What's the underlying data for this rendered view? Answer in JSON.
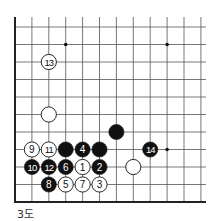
{
  "diagram": {
    "caption": "3도",
    "grid": {
      "cols": 12,
      "rows": 11,
      "x0": 15,
      "dx": 16.9,
      "y0": 27,
      "dy": 17.5,
      "top_y": 17,
      "open_right_x": 206
    },
    "star_points": [
      {
        "c": 3,
        "r": 1
      },
      {
        "c": 9,
        "r": 1
      },
      {
        "c": 9,
        "r": 7
      }
    ],
    "stones": [
      {
        "c": 2,
        "r": 2,
        "color": "white",
        "label": "13"
      },
      {
        "c": 2,
        "r": 5,
        "color": "white",
        "label": ""
      },
      {
        "c": 6,
        "r": 6,
        "color": "black",
        "label": ""
      },
      {
        "c": 1,
        "r": 7,
        "color": "white",
        "label": "9"
      },
      {
        "c": 2,
        "r": 7,
        "color": "white",
        "label": "11"
      },
      {
        "c": 3,
        "r": 7,
        "color": "black",
        "label": ""
      },
      {
        "c": 4,
        "r": 7,
        "color": "black",
        "label": "4"
      },
      {
        "c": 5,
        "r": 7,
        "color": "black",
        "label": ""
      },
      {
        "c": 8,
        "r": 7,
        "color": "black",
        "label": "14"
      },
      {
        "c": 1,
        "r": 8,
        "color": "black",
        "label": "10"
      },
      {
        "c": 2,
        "r": 8,
        "color": "black",
        "label": "12"
      },
      {
        "c": 3,
        "r": 8,
        "color": "black",
        "label": "6"
      },
      {
        "c": 4,
        "r": 8,
        "color": "white",
        "label": "1"
      },
      {
        "c": 5,
        "r": 8,
        "color": "black",
        "label": "2"
      },
      {
        "c": 7,
        "r": 8,
        "color": "white",
        "label": ""
      },
      {
        "c": 2,
        "r": 9,
        "color": "black",
        "label": "8"
      },
      {
        "c": 3,
        "r": 9,
        "color": "white",
        "label": "5"
      },
      {
        "c": 4,
        "r": 9,
        "color": "white",
        "label": "7"
      },
      {
        "c": 5,
        "r": 9,
        "color": "white",
        "label": "3"
      }
    ]
  }
}
